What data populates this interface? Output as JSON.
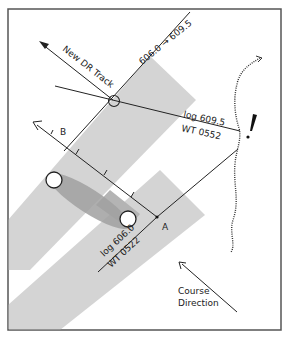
{
  "diagram": {
    "type": "running-fix navigation plot",
    "labels": {
      "new_dr_track": "New DR Track",
      "log_transfer": "606.0 → 609.5",
      "log_second": "log 609.5",
      "time_second": "WT 0552",
      "log_first": "log 606.0",
      "time_first": "WT 0522",
      "point_a": "A",
      "point_b": "B",
      "course_direction_line1": "Course",
      "course_direction_line2": "Direction"
    },
    "colors": {
      "frame": "#555555",
      "line": "#222222",
      "band_light": "#d4d4d4",
      "band_dark": "#a8a8a8",
      "ellipse": "#9a9a9a"
    },
    "elements": [
      "running-fix circle",
      "new DR track arrow",
      "advanced line of position",
      "second line of position (log 609.5 / WT 0552)",
      "first line of position (log 606.0 / WT 0522)",
      "course line A to B with tick marks",
      "shaded uncertainty bands",
      "error ellipse between two fix circles",
      "coastline with hazard mark",
      "course direction arrow"
    ]
  }
}
